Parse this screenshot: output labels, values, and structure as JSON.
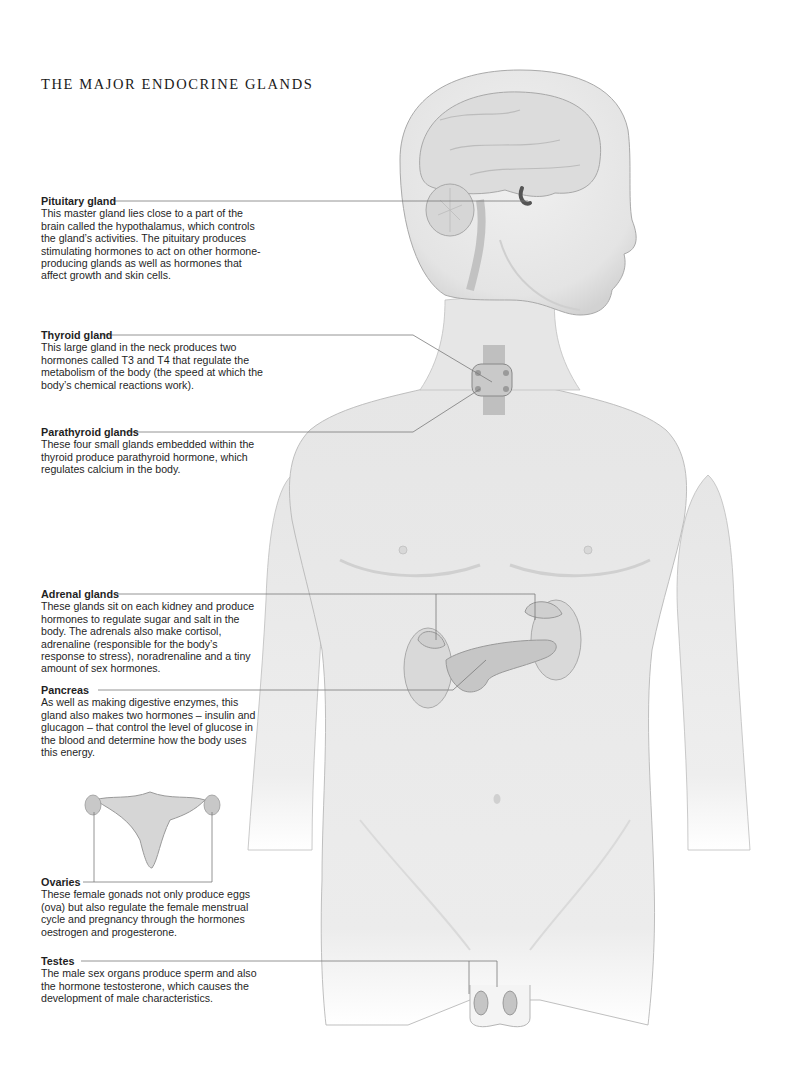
{
  "title": "THE MAJOR ENDOCRINE GLANDS",
  "glands": [
    {
      "name": "Pituitary gland",
      "description": "This master gland lies close to a part of the brain called the hypothalamus, which controls the gland’s activities. The pituitary produces stimulating hormones to act on other hormone-producing glands as well as hormones that affect growth and skin cells."
    },
    {
      "name": "Thyroid gland",
      "description": "This large gland in the neck produces two hormones called T3 and T4 that regulate the metabolism of the body (the speed at which the body’s chemical reactions work)."
    },
    {
      "name": "Parathyroid glands",
      "description": "These four small glands embedded within the thyroid produce parathyroid hormone, which regulates calcium in the body."
    },
    {
      "name": "Adrenal glands",
      "description": "These glands sit on each kidney and produce hormones to regulate sugar and salt in the body. The adrenals also make cortisol, adrenaline (responsible for the body’s response to stress), noradrenaline and a tiny amount of sex hormones."
    },
    {
      "name": "Pancreas",
      "description": "As well as making digestive enzymes, this gland also makes two hormones – insulin and glucagon – that control the level of glucose in the blood and determine how the body uses this energy."
    },
    {
      "name": "Ovaries",
      "description": "These female gonads not only produce eggs (ova) but also regulate the female menstrual cycle and pregnancy through the hormones oestrogen and progesterone."
    },
    {
      "name": "Testes",
      "description": "The male sex organs produce sperm and also the hormone testosterone, which causes the development of male characteristics."
    }
  ]
}
